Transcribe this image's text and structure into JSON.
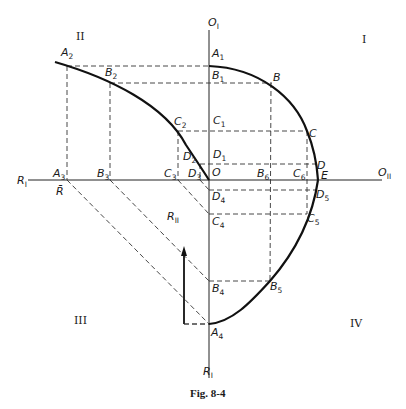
{
  "figure": {
    "caption": "Fig. 8-4",
    "quadrants": {
      "q1": "I",
      "q2": "II",
      "q3": "III",
      "q4": "IV"
    },
    "axes": {
      "top": {
        "main": "O",
        "sub": "I"
      },
      "right": {
        "main": "O",
        "sub": "II"
      },
      "left": {
        "main": "R",
        "sub": "I"
      },
      "bottom": {
        "main": "R",
        "sub": "I"
      },
      "arrow": {
        "main": "R",
        "sub": "II"
      },
      "origin": "O",
      "rbar": "R̄"
    },
    "points": {
      "A1": {
        "main": "A",
        "sub": "1"
      },
      "B1": {
        "main": "B",
        "sub": "1"
      },
      "C1": {
        "main": "C",
        "sub": "1"
      },
      "D1": {
        "main": "D",
        "sub": "1"
      },
      "A2": {
        "main": "A",
        "sub": "2"
      },
      "B2": {
        "main": "B",
        "sub": "2"
      },
      "C2": {
        "main": "C",
        "sub": "2"
      },
      "D2": {
        "main": "D",
        "sub": "2"
      },
      "A3": {
        "main": "A",
        "sub": "3"
      },
      "B3": {
        "main": "B",
        "sub": "3"
      },
      "C3": {
        "main": "C",
        "sub": "3"
      },
      "D3": {
        "main": "D",
        "sub": "3"
      },
      "A4": {
        "main": "A",
        "sub": "4"
      },
      "B4": {
        "main": "B",
        "sub": "4"
      },
      "C4": {
        "main": "C",
        "sub": "4"
      },
      "D4": {
        "main": "D",
        "sub": "4"
      },
      "B5": {
        "main": "B",
        "sub": "5"
      },
      "C5": {
        "main": "C",
        "sub": "5"
      },
      "D5": {
        "main": "D",
        "sub": "5"
      },
      "B6": {
        "main": "B",
        "sub": "6"
      },
      "C6": {
        "main": "C",
        "sub": "6"
      },
      "B": {
        "main": "B",
        "sub": ""
      },
      "C": {
        "main": "C",
        "sub": ""
      },
      "D": {
        "main": "D",
        "sub": ""
      },
      "E": {
        "main": "E",
        "sub": ""
      }
    }
  }
}
